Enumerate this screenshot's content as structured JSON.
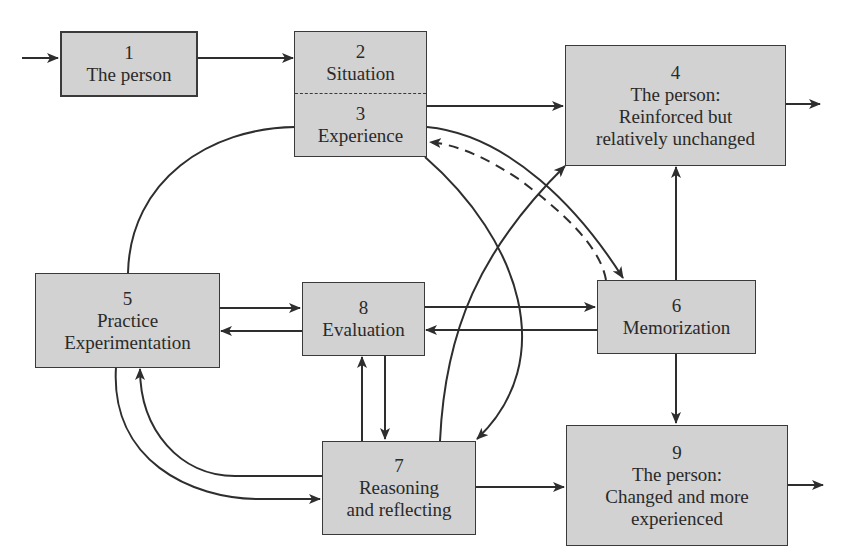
{
  "diagram": {
    "type": "flowchart",
    "nodes": [
      {
        "id": "1",
        "number": "1",
        "lines": [
          "The person"
        ]
      },
      {
        "id": "2",
        "number": "2",
        "lines": [
          "Situation"
        ]
      },
      {
        "id": "3",
        "number": "3",
        "lines": [
          "Experience"
        ]
      },
      {
        "id": "4",
        "number": "4",
        "lines": [
          "The person:",
          "Reinforced but",
          "relatively unchanged"
        ]
      },
      {
        "id": "5",
        "number": "5",
        "lines": [
          "Practice",
          "Experimentation"
        ]
      },
      {
        "id": "6",
        "number": "6",
        "lines": [
          "Memorization"
        ]
      },
      {
        "id": "7",
        "number": "7",
        "lines": [
          "Reasoning",
          "and reflecting"
        ]
      },
      {
        "id": "8",
        "number": "8",
        "lines": [
          "Evaluation"
        ]
      },
      {
        "id": "9",
        "number": "9",
        "lines": [
          "The person:",
          "Changed and more",
          "experienced"
        ]
      }
    ],
    "edges": [
      {
        "from": "input",
        "to": "1",
        "style": "solid"
      },
      {
        "from": "1",
        "to": "2",
        "style": "solid"
      },
      {
        "from": "3",
        "to": "4",
        "style": "solid"
      },
      {
        "from": "4",
        "to": "output",
        "style": "solid"
      },
      {
        "from": "3",
        "to": "5",
        "style": "solid",
        "arrow": false
      },
      {
        "from": "3",
        "to": "6",
        "style": "solid"
      },
      {
        "from": "6",
        "to": "3",
        "style": "dashed"
      },
      {
        "from": "3",
        "to": "7",
        "style": "solid"
      },
      {
        "from": "7",
        "to": "4",
        "style": "solid"
      },
      {
        "from": "5",
        "to": "8",
        "style": "solid"
      },
      {
        "from": "8",
        "to": "5",
        "style": "solid"
      },
      {
        "from": "8",
        "to": "6",
        "style": "solid"
      },
      {
        "from": "6",
        "to": "8",
        "style": "solid"
      },
      {
        "from": "6",
        "to": "4",
        "style": "solid"
      },
      {
        "from": "6",
        "to": "9",
        "style": "solid"
      },
      {
        "from": "7",
        "to": "8",
        "style": "solid"
      },
      {
        "from": "8",
        "to": "7",
        "style": "solid"
      },
      {
        "from": "5",
        "to": "7",
        "style": "solid"
      },
      {
        "from": "7",
        "to": "5",
        "style": "solid"
      },
      {
        "from": "7",
        "to": "9",
        "style": "solid"
      },
      {
        "from": "9",
        "to": "output",
        "style": "solid"
      }
    ]
  },
  "boxes": {
    "b1": {
      "num": "1",
      "l1": "The person"
    },
    "b2": {
      "num": "2",
      "l1": "Situation"
    },
    "b3": {
      "num": "3",
      "l1": "Experience"
    },
    "b4": {
      "num": "4",
      "l1": "The person:",
      "l2": "Reinforced but",
      "l3": "relatively unchanged"
    },
    "b5": {
      "num": "5",
      "l1": "Practice",
      "l2": "Experimentation"
    },
    "b6": {
      "num": "6",
      "l1": "Memorization"
    },
    "b7": {
      "num": "7",
      "l1": "Reasoning",
      "l2": "and reflecting"
    },
    "b8": {
      "num": "8",
      "l1": "Evaluation"
    },
    "b9": {
      "num": "9",
      "l1": "The person:",
      "l2": "Changed and more",
      "l3": "experienced"
    }
  },
  "colors": {
    "box_fill": "#d2d2d2",
    "stroke": "#2e2e2e",
    "background": "#ffffff"
  }
}
